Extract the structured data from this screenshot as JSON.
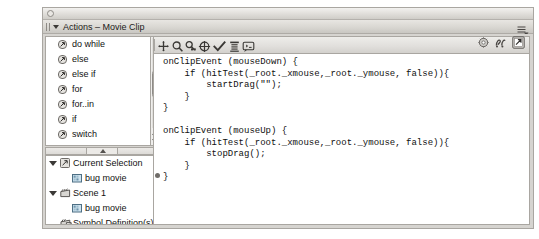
{
  "window": {
    "close_button": "close-button",
    "panel_title": "Actions – Movie Clip",
    "panel_menu_icon": "panel-menu-icon",
    "collapse_arrow_icon": "collapse-arrow-icon",
    "grip_icon": "grip-icon"
  },
  "actions_list": {
    "items": [
      {
        "label": "do while",
        "icon": "action-item-icon",
        "level": "child"
      },
      {
        "label": "else",
        "icon": "action-item-icon",
        "level": "child"
      },
      {
        "label": "else if",
        "icon": "action-item-icon",
        "level": "child"
      },
      {
        "label": "for",
        "icon": "action-item-icon",
        "level": "child"
      },
      {
        "label": "for..in",
        "icon": "action-item-icon",
        "level": "child"
      },
      {
        "label": "if",
        "icon": "action-item-icon",
        "level": "child"
      },
      {
        "label": "switch",
        "icon": "action-item-icon",
        "level": "child"
      },
      {
        "label": "while",
        "icon": "action-item-icon",
        "level": "child"
      },
      {
        "label": "Exceptions",
        "icon": "action-folder-icon",
        "level": "root"
      },
      {
        "label": "User–Defined Functi",
        "icon": "action-folder-icon",
        "level": "root"
      }
    ],
    "scrollbar": {
      "up_arrow": "scroll-up-arrow",
      "down_arrow": "scroll-down-arrow",
      "thumb": "scroll-thumb"
    }
  },
  "splitter": {
    "handle_icon": "splitter-handle-icon"
  },
  "tree_panel": {
    "rows": [
      {
        "label": "Current Selection",
        "icon": "script-icon",
        "twisty": "expanded",
        "indent": 0
      },
      {
        "label": "bug movie",
        "icon": "movie-clip-icon",
        "twisty": "none",
        "indent": 1
      },
      {
        "label": "Scene 1",
        "icon": "scene-icon",
        "twisty": "expanded",
        "indent": 0
      },
      {
        "label": "bug movie",
        "icon": "movie-clip-icon",
        "twisty": "none",
        "indent": 1
      },
      {
        "label": "Symbol Definition(s)",
        "icon": "symbol-definitions-icon",
        "twisty": "none",
        "indent": 0
      }
    ]
  },
  "code_toolbar": {
    "buttons": [
      {
        "name": "add-statement-button",
        "icon": "plus-crosshair-icon",
        "tooltip": "Add a new item to the script"
      },
      {
        "name": "find-button",
        "icon": "magnifier-icon",
        "tooltip": "Find"
      },
      {
        "name": "find-replace-button",
        "icon": "find-replace-icon",
        "tooltip": "Replace"
      },
      {
        "name": "insert-target-path-button",
        "icon": "target-crosshair-icon",
        "tooltip": "Insert a target path"
      },
      {
        "name": "check-syntax-button",
        "icon": "checkmark-icon",
        "tooltip": "Check syntax"
      },
      {
        "name": "auto-format-button",
        "icon": "auto-format-icon",
        "tooltip": "Auto format"
      },
      {
        "name": "show-code-hint-button",
        "icon": "code-hint-icon",
        "tooltip": "Show code hint"
      }
    ]
  },
  "window_icons": [
    {
      "name": "reference-button",
      "icon": "reference-gear-icon"
    },
    {
      "name": "view-options-button",
      "icon": "view-options-icon"
    },
    {
      "name": "pin-script-button",
      "icon": "pin-script-icon"
    }
  ],
  "code_editor": {
    "script": "onClipEvent (mouseDown) {\n    if (hitTest(_root._xmouse,_root._ymouse, false)){\n        startDrag(\"\");\n    }\n}\n\nonClipEvent (mouseUp) {\n    if (hitTest(_root._xmouse,_root._ymouse, false)){\n        stopDrag();\n    }\n}",
    "marker_icon": "line-marker-dot"
  },
  "colors": {
    "window_bg": "#d6d4d0",
    "panel_border": "#a9a6a1",
    "code_bg": "#ffffff",
    "text": "#121110"
  }
}
